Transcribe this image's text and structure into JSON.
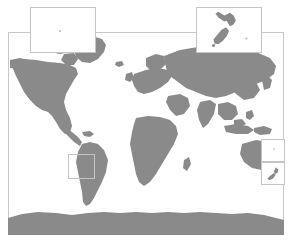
{
  "figure": {
    "name": "world-map-figure",
    "width": 292,
    "height": 243,
    "background_color": "#ffffff"
  },
  "map": {
    "projection": "equirectangular",
    "frame": {
      "left": 8,
      "top": 32,
      "width": 276,
      "height": 203,
      "border_color": "#c8c8c8"
    },
    "land_color": "#8a8a8a",
    "ocean_color": "#ffffff",
    "lon_range": [
      -180,
      180
    ],
    "lat_range": [
      -90,
      84
    ]
  },
  "insets": [
    {
      "id": "inset-topleft",
      "label": "",
      "has_marker": true,
      "marker_color": "#b5b5b5",
      "border_color": "#c4c4c4",
      "content": "none"
    },
    {
      "id": "inset-newzealand",
      "label": "",
      "has_marker": true,
      "marker_color": "#b5b5b5",
      "border_color": "#c4c4c4",
      "content": "new-zealand"
    },
    {
      "id": "inset-patagonia",
      "label": "",
      "has_marker": false,
      "marker_color": "#b5b5b5",
      "border_color": "#c4c4c4",
      "content": "none"
    },
    {
      "id": "inset-australia-upper",
      "label": "",
      "has_marker": true,
      "marker_color": "#cfcfcf",
      "border_color": "#c4c4c4",
      "content": "none"
    },
    {
      "id": "inset-australia-lower",
      "label": "",
      "has_marker": false,
      "marker_color": "#b5b5b5",
      "border_color": "#c4c4c4",
      "content": "new-zealand-small"
    }
  ]
}
